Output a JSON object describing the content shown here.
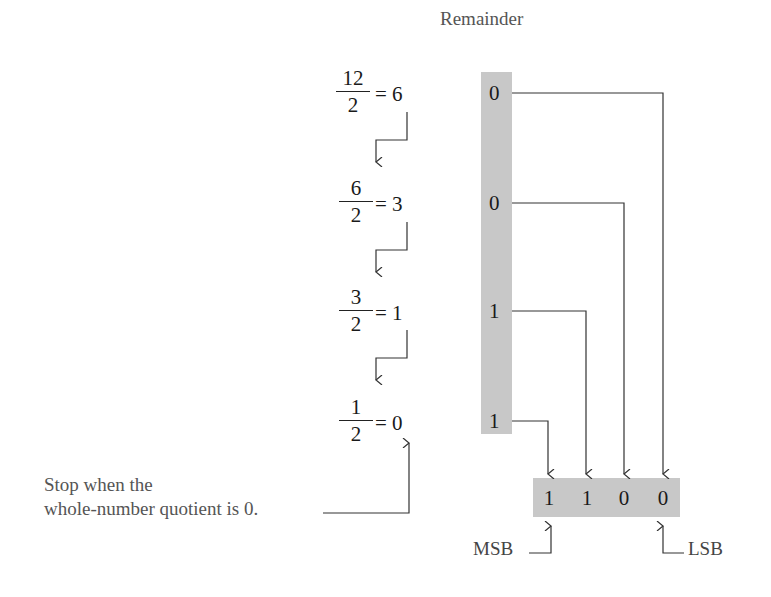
{
  "header": {
    "title": "Remainder"
  },
  "steps": [
    {
      "numerator": "12",
      "denominator": "2",
      "quotient": "6",
      "remainder": "0"
    },
    {
      "numerator": "6",
      "denominator": "2",
      "quotient": "3",
      "remainder": "0"
    },
    {
      "numerator": "3",
      "denominator": "2",
      "quotient": "1",
      "remainder": "1"
    },
    {
      "numerator": "1",
      "denominator": "2",
      "quotient": "0",
      "remainder": "1"
    }
  ],
  "equals_sign": "=",
  "result": {
    "bits": [
      "1",
      "1",
      "0",
      "0"
    ]
  },
  "labels": {
    "msb": "MSB",
    "lsb": "LSB"
  },
  "caption": {
    "line1": "Stop when the",
    "line2": "whole-number quotient is 0."
  },
  "colors": {
    "shade": "#c8c8c8",
    "line": "#333333",
    "caption": "#555555"
  }
}
